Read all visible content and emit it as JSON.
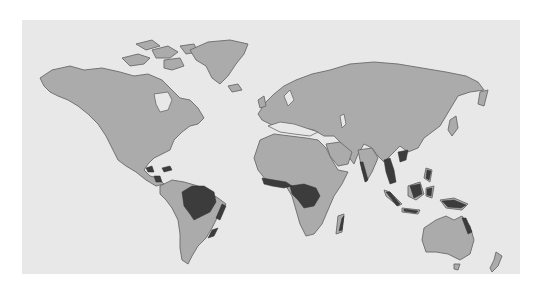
{
  "map": {
    "type": "world-map",
    "projection": "equirectangular",
    "style": "grayscale",
    "colors": {
      "background": "#ffffff",
      "ocean": "#e8e8e8",
      "land": "#ababab",
      "coastline": "#6a6a6a",
      "highlighted_region": "#3c3c3c"
    },
    "highlighted_regions": [
      {
        "name": "Amazon basin",
        "continent": "South America"
      },
      {
        "name": "Atlantic coast of Brazil",
        "continent": "South America"
      },
      {
        "name": "Central America",
        "continent": "North America"
      },
      {
        "name": "Caribbean islands",
        "continent": "North America"
      },
      {
        "name": "West Africa coast",
        "continent": "Africa"
      },
      {
        "name": "Congo basin",
        "continent": "Africa"
      },
      {
        "name": "Eastern Madagascar",
        "continent": "Africa"
      },
      {
        "name": "Western Ghats",
        "continent": "Asia"
      },
      {
        "name": "Southeast Asia mainland",
        "continent": "Asia"
      },
      {
        "name": "Malay archipelago",
        "continent": "Asia"
      },
      {
        "name": "New Guinea",
        "continent": "Oceania"
      },
      {
        "name": "Northeast Queensland",
        "continent": "Oceania"
      }
    ]
  }
}
